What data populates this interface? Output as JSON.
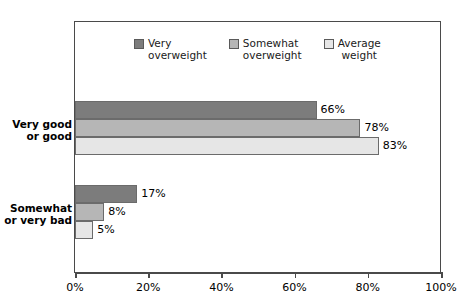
{
  "chart_data": {
    "type": "bar",
    "orientation": "horizontal",
    "title": "",
    "xlabel": "",
    "ylabel": "",
    "xlim": [
      0,
      100
    ],
    "xtick_labels": [
      "0%",
      "20%",
      "40%",
      "60%",
      "80%",
      "100%"
    ],
    "xticks": [
      0,
      20,
      40,
      60,
      80,
      100
    ],
    "grid": false,
    "legend_position": "top-center",
    "categories": [
      "Very good or good",
      "Somewhat or very bad"
    ],
    "category_lines": [
      [
        "Very good",
        "or good"
      ],
      [
        "Somewhat",
        "or very bad"
      ]
    ],
    "series": [
      {
        "name": "Very overweight",
        "name_lines": [
          "Very",
          "overweight"
        ],
        "color": "#7c7c7c",
        "values": [
          66,
          78
        ],
        "labels": [
          "66%",
          "17%"
        ]
      },
      {
        "name": "Somewhat overweight",
        "name_lines": [
          "Somewhat",
          "overweight"
        ],
        "color": "#b6b6b6",
        "values": [
          78,
          8
        ],
        "labels": [
          "78%",
          "8%"
        ]
      },
      {
        "name": "Average weight",
        "name_lines": [
          "Average",
          "weight"
        ],
        "color": "#e6e6e6",
        "values": [
          83,
          5
        ],
        "labels": [
          "83%",
          "5%"
        ]
      }
    ],
    "groups": [
      {
        "category": "Very good or good",
        "bars": [
          {
            "series": "Very overweight",
            "value": 66,
            "label": "66%",
            "color": "#7c7c7c"
          },
          {
            "series": "Somewhat overweight",
            "value": 78,
            "label": "78%",
            "color": "#b6b6b6"
          },
          {
            "series": "Average weight",
            "value": 83,
            "label": "83%",
            "color": "#e6e6e6"
          }
        ]
      },
      {
        "category": "Somewhat or very bad",
        "bars": [
          {
            "series": "Very overweight",
            "value": 17,
            "label": "17%",
            "color": "#7c7c7c"
          },
          {
            "series": "Somewhat overweight",
            "value": 8,
            "label": "8%",
            "color": "#b6b6b6"
          },
          {
            "series": "Average weight",
            "value": 5,
            "label": "5%",
            "color": "#e6e6e6"
          }
        ]
      }
    ]
  },
  "legend": {
    "items": [
      {
        "line1": "Very",
        "line2": "overweight",
        "color": "#7c7c7c"
      },
      {
        "line1": "Somewhat",
        "line2": "overweight",
        "color": "#b6b6b6"
      },
      {
        "line1": "Average",
        "line2": "weight",
        "color": "#e6e6e6"
      }
    ]
  },
  "axis": {
    "ticks": [
      {
        "label": "0%",
        "value": 0
      },
      {
        "label": "20%",
        "value": 20
      },
      {
        "label": "40%",
        "value": 40
      },
      {
        "label": "60%",
        "value": 60
      },
      {
        "label": "80%",
        "value": 80
      },
      {
        "label": "100%",
        "value": 100
      }
    ]
  },
  "categories": {
    "items": [
      {
        "line1": "Very good",
        "line2": "or good"
      },
      {
        "line1": "Somewhat",
        "line2": "or very bad"
      }
    ]
  },
  "title": {
    "text": ""
  }
}
